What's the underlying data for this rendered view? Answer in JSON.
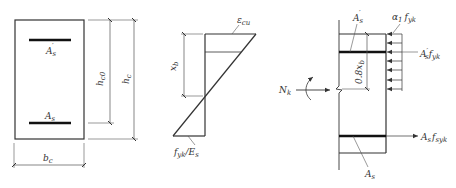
{
  "figure": {
    "colors": {
      "line": "#333333",
      "rebar": "#111111",
      "dim": "#555555",
      "background": "#ffffff"
    }
  },
  "cross_section": {
    "top_rebar_label": {
      "base": "A",
      "sub": "s",
      "prime": "′"
    },
    "bottom_rebar_label": {
      "base": "A",
      "sub": "s"
    },
    "width_label": {
      "base": "b",
      "sub": "c"
    },
    "effective_depth_label": {
      "base": "h",
      "sub": "c0"
    },
    "depth_label": {
      "base": "h",
      "sub": "c"
    }
  },
  "strain_diagram": {
    "top_strain_label": {
      "base": "ε",
      "sub": "cu"
    },
    "bottom_strain_label": {
      "base": "f",
      "sub": "yk",
      "tail": "/E",
      "tail_sub": "s"
    },
    "neutral_axis_depth_label": {
      "base": "x",
      "sub": "b"
    }
  },
  "stress_diagram": {
    "axial_force_label": {
      "base": "N",
      "sub": "k"
    },
    "compression_rebar_label": {
      "base": "A",
      "sub": "s",
      "prime": "′"
    },
    "concrete_stress_label": {
      "base": "α",
      "sub": "1",
      "tail": "f",
      "tail_sub": "yk"
    },
    "compression_force_label": {
      "base": "A",
      "prime": "′",
      "sub": "s",
      "tail": "f",
      "tail_sub": "yk"
    },
    "block_depth_label": "0.8x",
    "block_depth_sub": "b",
    "tension_force_label": {
      "base": "A",
      "sub": "s",
      "tail": "f",
      "tail_sub": "syk"
    },
    "tension_rebar_label": {
      "base": "A",
      "sub": "s"
    }
  }
}
